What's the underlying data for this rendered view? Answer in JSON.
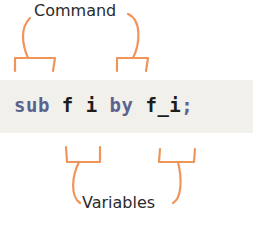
{
  "labels": {
    "command": "Command",
    "variables": "Variables"
  },
  "code": {
    "tokens": [
      {
        "text": "sub",
        "role": "command"
      },
      {
        "text": " ",
        "role": "space"
      },
      {
        "text": "f",
        "role": "variable"
      },
      {
        "text": " ",
        "role": "space"
      },
      {
        "text": "i",
        "role": "variable"
      },
      {
        "text": " ",
        "role": "space"
      },
      {
        "text": "by",
        "role": "command"
      },
      {
        "text": " ",
        "role": "space"
      },
      {
        "text": "f_i",
        "role": "variable"
      },
      {
        "text": ";",
        "role": "command"
      }
    ],
    "t0": "sub",
    "t1": " ",
    "t2": "f",
    "t3": " ",
    "t4": "i",
    "t5": " ",
    "t6": "by",
    "t7": " ",
    "t8": "f_i",
    "t9": ";"
  },
  "colors": {
    "bracket": "#f0955a",
    "keyword": "#5a6390",
    "variable": "#1c1c1c",
    "code_background": "#f2f0ea",
    "label_text": "#2a2a2a"
  },
  "annotations": [
    {
      "label": "Command",
      "targets": [
        "sub",
        "by"
      ],
      "position": "above"
    },
    {
      "label": "Variables",
      "targets": [
        "f i",
        "f_i"
      ],
      "position": "below"
    }
  ]
}
